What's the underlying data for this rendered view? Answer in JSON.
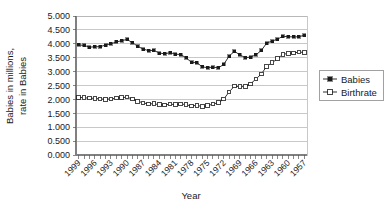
{
  "chart_data": {
    "type": "line",
    "title": "",
    "xlabel": "Year",
    "ylabel": "Babies in millions,\nrate in Babies",
    "ylabel_line1": "Babies in millions,",
    "ylabel_line2": "rate in Babies",
    "ylim": [
      0.0,
      5.0
    ],
    "ytick_labels": [
      "5.000",
      "4.500",
      "4.000",
      "3.500",
      "3.000",
      "2.500",
      "2.000",
      "1.500",
      "1.000",
      "0.500",
      "0.000"
    ],
    "ytick_values": [
      5.0,
      4.5,
      4.0,
      3.5,
      3.0,
      2.5,
      2.0,
      1.5,
      1.0,
      0.5,
      0.0
    ],
    "grid": true,
    "legend_position": "right",
    "x_axis_direction": "descending",
    "x": [
      1999,
      1998,
      1997,
      1996,
      1995,
      1994,
      1993,
      1992,
      1991,
      1990,
      1989,
      1988,
      1987,
      1986,
      1985,
      1984,
      1983,
      1982,
      1981,
      1980,
      1979,
      1978,
      1977,
      1976,
      1975,
      1974,
      1973,
      1972,
      1971,
      1970,
      1969,
      1968,
      1967,
      1966,
      1965,
      1964,
      1963,
      1962,
      1961,
      1960,
      1959,
      1958,
      1957
    ],
    "xtick_labels": [
      "1999",
      "1996",
      "1993",
      "1990",
      "1987",
      "1984",
      "1981",
      "1978",
      "1975",
      "1972",
      "1969",
      "1966",
      "1963",
      "1960",
      "1957"
    ],
    "xtick_values": [
      1999,
      1996,
      1993,
      1990,
      1987,
      1984,
      1981,
      1978,
      1975,
      1972,
      1969,
      1966,
      1963,
      1960,
      1957
    ],
    "series": [
      {
        "name": "Babies",
        "marker": "filled-square",
        "values": [
          3.959,
          3.942,
          3.881,
          3.891,
          3.9,
          3.953,
          4.0,
          4.065,
          4.111,
          4.158,
          4.041,
          3.91,
          3.809,
          3.757,
          3.761,
          3.669,
          3.639,
          3.681,
          3.629,
          3.612,
          3.494,
          3.333,
          3.327,
          3.168,
          3.144,
          3.16,
          3.137,
          3.258,
          3.556,
          3.731,
          3.6,
          3.502,
          3.521,
          3.606,
          3.76,
          4.027,
          4.098,
          4.167,
          4.268,
          4.258,
          4.245,
          4.255,
          4.308
        ]
      },
      {
        "name": "Birthrate",
        "marker": "hollow-square",
        "values": [
          2.075,
          2.059,
          2.044,
          2.038,
          2.02,
          2.002,
          2.02,
          2.046,
          2.062,
          2.081,
          2.014,
          1.934,
          1.872,
          1.838,
          1.844,
          1.807,
          1.799,
          1.828,
          1.812,
          1.84,
          1.808,
          1.76,
          1.79,
          1.738,
          1.774,
          1.835,
          1.879,
          2.01,
          2.267,
          2.48,
          2.456,
          2.464,
          2.558,
          2.736,
          2.913,
          3.191,
          3.319,
          3.461,
          3.62,
          3.654,
          3.67,
          3.701,
          3.69
        ]
      }
    ]
  },
  "legend": {
    "entries": [
      {
        "label": "Babies",
        "marker": "filled-square"
      },
      {
        "label": "Birthrate",
        "marker": "hollow-square"
      }
    ]
  }
}
